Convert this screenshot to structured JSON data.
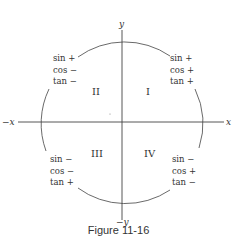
{
  "axes": {
    "x_pos": "x",
    "x_neg": "−x",
    "y_pos": "y",
    "y_neg": "−y"
  },
  "quadrants": [
    {
      "numeral": "I",
      "sin": "sin  +",
      "cos": "cos +",
      "tan": "tan +"
    },
    {
      "numeral": "II",
      "sin": "sin  +",
      "cos": "cos −",
      "tan": "tan −"
    },
    {
      "numeral": "III",
      "sin": "sin  −",
      "cos": "cos −",
      "tan": "tan +"
    },
    {
      "numeral": "IV",
      "sin": "sin  −",
      "cos": "cos +",
      "tan": "tan −"
    }
  ],
  "caption": "Figure 11-16",
  "colors": {
    "line": "#444444",
    "text": "#333333"
  }
}
